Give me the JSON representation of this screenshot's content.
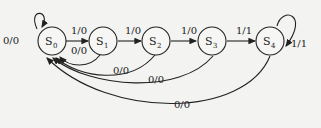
{
  "diagram": {
    "type": "state-machine",
    "states": [
      {
        "id": "S0",
        "name": "S",
        "sub": "0"
      },
      {
        "id": "S1",
        "name": "S",
        "sub": "1"
      },
      {
        "id": "S2",
        "name": "S",
        "sub": "2"
      },
      {
        "id": "S3",
        "name": "S",
        "sub": "3"
      },
      {
        "id": "S4",
        "name": "S",
        "sub": "4"
      }
    ],
    "transitions": [
      {
        "from": "S0",
        "to": "S0",
        "label": "0/0"
      },
      {
        "from": "S0",
        "to": "S1",
        "label": "1/0"
      },
      {
        "from": "S1",
        "to": "S0",
        "label": "0/0"
      },
      {
        "from": "S1",
        "to": "S2",
        "label": "1/0"
      },
      {
        "from": "S2",
        "to": "S0",
        "label": "0/0"
      },
      {
        "from": "S2",
        "to": "S3",
        "label": "1/0"
      },
      {
        "from": "S3",
        "to": "S0",
        "label": "0/0"
      },
      {
        "from": "S3",
        "to": "S4",
        "label": "1/1"
      },
      {
        "from": "S4",
        "to": "S4",
        "label": "1/1"
      },
      {
        "from": "S4",
        "to": "S0",
        "label": "0/0"
      }
    ]
  }
}
